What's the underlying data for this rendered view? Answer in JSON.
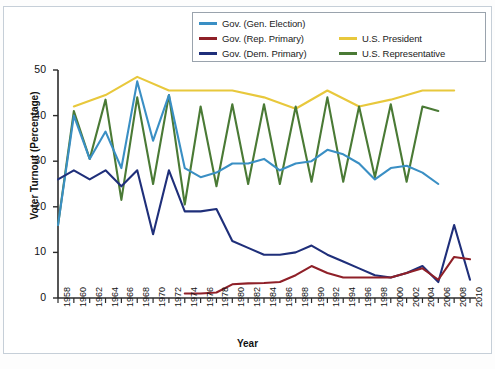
{
  "chart_data": {
    "type": "line",
    "title": "",
    "xlabel": "Year",
    "ylabel": "Voter Turnout (Percentage)",
    "xlim": [
      1958,
      2010
    ],
    "ylim": [
      0,
      50
    ],
    "yticks": [
      0,
      10,
      20,
      30,
      40,
      50
    ],
    "grid": false,
    "legend_position": "top-center",
    "x": [
      1958,
      1960,
      1962,
      1964,
      1966,
      1968,
      1970,
      1972,
      1974,
      1976,
      1978,
      1980,
      1982,
      1984,
      1986,
      1988,
      1990,
      1992,
      1994,
      1996,
      1998,
      2000,
      2002,
      2004,
      2006,
      2008,
      2010
    ],
    "series": [
      {
        "name": "Gov. (Gen. Election)",
        "color": "#3a8fc4",
        "x": [
          1958,
          1960,
          1962,
          1964,
          1966,
          1968,
          1970,
          1972,
          1974,
          1976,
          1978,
          1980,
          1982,
          1984,
          1986,
          1988,
          1990,
          1992,
          1994,
          1996,
          1998,
          2000,
          2002,
          2004,
          2006
        ],
        "values": [
          16.0,
          40.0,
          30.5,
          36.5,
          28.5,
          47.5,
          34.5,
          44.5,
          28.5,
          26.5,
          27.5,
          29.5,
          29.5,
          30.5,
          28.0,
          29.5,
          30.0,
          32.5,
          31.5,
          29.5,
          26.0,
          28.5,
          29.0,
          27.5,
          25.0
        ]
      },
      {
        "name": "Gov. (Rep. Primary)",
        "color": "#8f2028",
        "x": [
          1974,
          1976,
          1978,
          1980,
          1982,
          1984,
          1986,
          1988,
          1990,
          1992,
          1994,
          1996,
          1998,
          2000,
          2002,
          2004,
          2006,
          2008,
          2010
        ],
        "values": [
          1.0,
          1.0,
          1.2,
          3.0,
          3.2,
          3.3,
          3.5,
          5.0,
          7.0,
          5.5,
          4.5,
          4.5,
          4.5,
          4.5,
          5.5,
          6.5,
          4.0,
          9.0,
          8.5
        ]
      },
      {
        "name": "Gov. (Dem. Primary)",
        "color": "#1f2f7a",
        "x": [
          1958,
          1960,
          1962,
          1964,
          1966,
          1968,
          1970,
          1972,
          1974,
          1976,
          1978,
          1980,
          1982,
          1984,
          1986,
          1988,
          1990,
          1992,
          1994,
          1996,
          1998,
          2000,
          2002,
          2004,
          2006,
          2008,
          2010
        ],
        "values": [
          26.0,
          28.0,
          26.0,
          28.0,
          24.5,
          28.0,
          14.0,
          28.0,
          19.0,
          19.0,
          19.5,
          12.5,
          11.0,
          9.5,
          9.5,
          10.0,
          11.5,
          9.5,
          8.0,
          6.5,
          5.0,
          4.5,
          5.5,
          7.0,
          3.5,
          16.0,
          4.0
        ]
      },
      {
        "name": "U.S. President",
        "color": "#e8c83c",
        "x": [
          1960,
          1964,
          1968,
          1972,
          1976,
          1980,
          1984,
          1988,
          1992,
          1996,
          2000,
          2004,
          2008
        ],
        "values": [
          42.0,
          44.5,
          48.5,
          45.5,
          45.5,
          45.5,
          44.0,
          41.5,
          45.5,
          42.0,
          43.5,
          45.5,
          45.5
        ]
      },
      {
        "name": "U.S. Representative",
        "color": "#4a7a35",
        "x": [
          1958,
          1960,
          1962,
          1964,
          1966,
          1968,
          1970,
          1972,
          1974,
          1976,
          1978,
          1980,
          1982,
          1984,
          1986,
          1988,
          1990,
          1992,
          1994,
          1996,
          1998,
          2000,
          2002,
          2004,
          2006
        ],
        "values": [
          16.0,
          41.0,
          30.5,
          43.5,
          21.5,
          44.0,
          25.0,
          44.5,
          20.5,
          42.0,
          24.5,
          42.5,
          25.0,
          42.5,
          25.0,
          42.0,
          25.5,
          44.0,
          25.5,
          42.0,
          26.5,
          42.5,
          25.5,
          42.0,
          41.0
        ]
      }
    ]
  },
  "legend": {
    "items": [
      {
        "label": "Gov. (Gen. Election)",
        "color": "#3a8fc4",
        "col": 1,
        "row": 1
      },
      {
        "label": "Gov. (Rep. Primary)",
        "color": "#8f2028",
        "col": 1,
        "row": 2
      },
      {
        "label": "Gov. (Dem. Primary)",
        "color": "#1f2f7a",
        "col": 1,
        "row": 3
      },
      {
        "label": "U.S. President",
        "color": "#e8c83c",
        "col": 2,
        "row": 2
      },
      {
        "label": "U.S. Representative",
        "color": "#4a7a35",
        "col": 2,
        "row": 3
      }
    ]
  }
}
